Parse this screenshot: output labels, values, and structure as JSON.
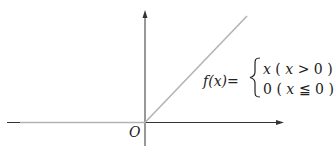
{
  "diagram": {
    "origin_label": "O",
    "function_name": "f(x)=",
    "cases": [
      {
        "value": "x",
        "condition_open": "(",
        "var": "x",
        "op": ">",
        "bound": "0",
        "condition_close": ")"
      },
      {
        "value": "0",
        "condition_open": "(",
        "var": "x",
        "op": "≦",
        "bound": "0",
        "condition_close": ")"
      }
    ],
    "colors": {
      "axis": "#333333",
      "function_line": "#b4b4b4",
      "text": "#222222",
      "background": "#ffffff"
    }
  }
}
